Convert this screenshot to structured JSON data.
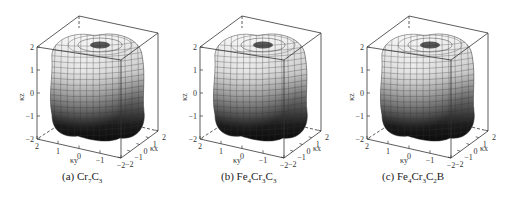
{
  "figure": {
    "panels": [
      {
        "id": "a",
        "label_prefix": "(a) ",
        "formula": [
          [
            "Cr",
            ""
          ],
          [
            "7",
            "sub"
          ],
          [
            "C",
            ""
          ],
          [
            "3",
            "sub"
          ]
        ],
        "caption": "(a) Cr7C3"
      },
      {
        "id": "b",
        "label_prefix": "(b) ",
        "formula": [
          [
            "Fe",
            ""
          ],
          [
            "4",
            "sub"
          ],
          [
            "Cr",
            ""
          ],
          [
            "3",
            "sub"
          ],
          [
            "C",
            ""
          ],
          [
            "3",
            "sub"
          ]
        ],
        "caption": "(b) Fe4Cr3C3"
      },
      {
        "id": "c",
        "label_prefix": "(c) ",
        "formula": [
          [
            "Fe",
            ""
          ],
          [
            "4",
            "sub"
          ],
          [
            "Cr",
            ""
          ],
          [
            "3",
            "sub"
          ],
          [
            "C",
            ""
          ],
          [
            "2",
            "sub"
          ],
          [
            "B",
            ""
          ]
        ],
        "caption": "(c) Fe4Cr3C2B"
      }
    ]
  },
  "chart_data": [
    {
      "type": "surface3d",
      "title": "(a) Cr7C3",
      "xlabel": "κx",
      "ylabel": "κy",
      "zlabel": "κz",
      "xlim": [
        -2,
        2
      ],
      "ylim": [
        -2,
        2
      ],
      "zlim": [
        -2,
        2
      ],
      "z_ticks": [
        "2",
        "1",
        "0",
        "-1",
        "-2"
      ],
      "y_ticks": [
        "2",
        "1",
        "0",
        "-1",
        "-2"
      ],
      "x_ticks": [
        "-2",
        "-1",
        "0",
        "1",
        "2"
      ],
      "grid": false,
      "description": "3D closed surface (rounded cube-like with top dimple), grayscale shading light at top to dark at bottom"
    },
    {
      "type": "surface3d",
      "title": "(b) Fe4Cr3C3",
      "xlabel": "κx",
      "ylabel": "κy",
      "zlabel": "κz",
      "xlim": [
        -2,
        2
      ],
      "ylim": [
        -2,
        2
      ],
      "zlim": [
        -2,
        2
      ],
      "z_ticks": [
        "2",
        "1",
        "0",
        "-1",
        "-2"
      ],
      "y_ticks": [
        "2",
        "1",
        "0",
        "-1",
        "-2"
      ],
      "x_ticks": [
        "-2",
        "-1",
        "0",
        "1",
        "2"
      ],
      "grid": false,
      "description": "3D closed surface (rounded cube-like with top dimple), grayscale shading"
    },
    {
      "type": "surface3d",
      "title": "(c) Fe4Cr3C2B",
      "xlabel": "κx",
      "ylabel": "κy",
      "zlabel": "κz",
      "xlim": [
        -2,
        2
      ],
      "ylim": [
        -2,
        2
      ],
      "zlim": [
        -2,
        2
      ],
      "z_ticks": [
        "2",
        "1",
        "0",
        "-1",
        "-2"
      ],
      "y_ticks": [
        "2",
        "1",
        "0",
        "-1",
        "-2"
      ],
      "x_ticks": [
        "-2",
        "-1",
        "0",
        "1",
        "2"
      ],
      "grid": false,
      "description": "3D closed surface (rounded cube-like with top dimple), grayscale shading"
    }
  ],
  "axes": {
    "z_label": "κz",
    "y_label": "κy",
    "x_label": "κx",
    "z_ticks": [
      "2",
      "1",
      "0",
      "-1",
      "-2"
    ],
    "front_ticks": [
      "2",
      "1",
      "0",
      "-1",
      "-2"
    ],
    "right_ticks": [
      "-2",
      "-1",
      "0",
      "1",
      "2"
    ]
  }
}
